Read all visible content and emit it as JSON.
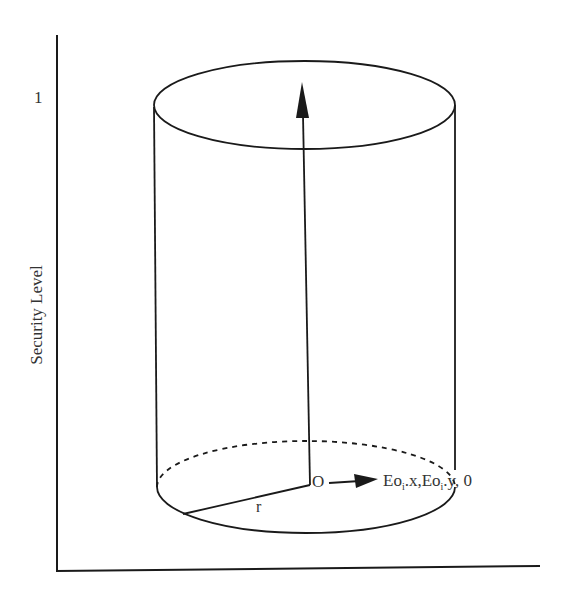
{
  "diagram": {
    "y_axis": {
      "label": "Security Level",
      "tick_label": "1"
    },
    "cylinder": {
      "origin_label": "O",
      "radius_label": "r",
      "vector_label_parts": [
        "Eo",
        "i",
        ".x,Eo",
        "i",
        ".y, 0"
      ]
    },
    "colors": {
      "stroke": "#1a1a1a",
      "text": "#333333",
      "background": "#ffffff"
    }
  }
}
